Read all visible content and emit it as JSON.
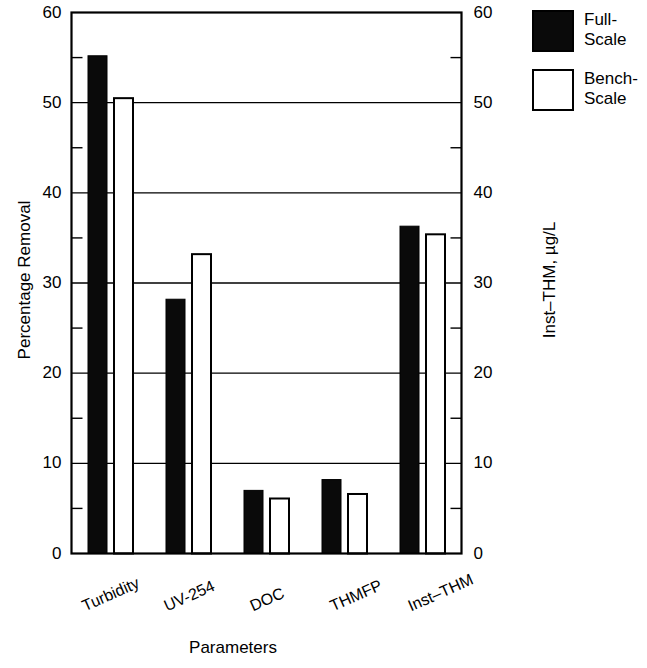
{
  "chart_data": {
    "type": "bar",
    "title": "",
    "subtitle": "",
    "xlabel": "Parameters",
    "ylabel": "Percentage Removal",
    "ylabel_right": "Inst–THM, µg/L",
    "categories": [
      "Turbidity",
      "UV-254",
      "DOC",
      "THMFP",
      "Inst–THM"
    ],
    "series": [
      {
        "name": "Full-Scale",
        "style": "filled",
        "color": "#0a0a0a",
        "values": [
          55.2,
          28.2,
          7.0,
          8.2,
          36.3
        ]
      },
      {
        "name": "Bench-Scale",
        "style": "open",
        "color": "#ffffff",
        "values": [
          50.5,
          33.2,
          6.1,
          6.6,
          35.4
        ]
      }
    ],
    "ylim": [
      0,
      60
    ],
    "ylim_right": [
      0,
      60
    ],
    "ytick_major": [
      0,
      10,
      20,
      30,
      40,
      50,
      60
    ],
    "ytick_minor": [
      5,
      15,
      25,
      35,
      45,
      55
    ],
    "ytick_labels_left": [
      "0",
      "10",
      "20",
      "30",
      "40",
      "50",
      "60"
    ],
    "ytick_labels_right": [
      "0",
      "10",
      "20",
      "30",
      "40",
      "50",
      "60"
    ],
    "grid": "horizontal-major",
    "legend_position": "outside-top-right",
    "legend_entries": [
      "Full-Scale",
      "Bench-Scale"
    ],
    "axis_color": "#000000",
    "background": "#ffffff"
  },
  "legend": {
    "items": [
      {
        "label_line1": "Full-",
        "label_line2": "Scale"
      },
      {
        "label_line1": "Bench-",
        "label_line2": "Scale"
      }
    ]
  }
}
